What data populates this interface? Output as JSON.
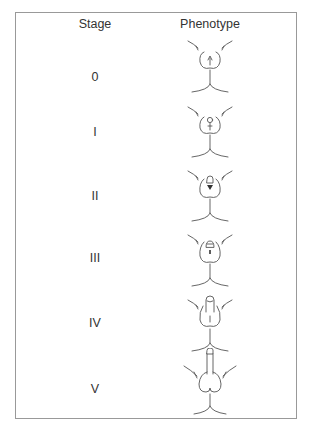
{
  "table": {
    "headers": {
      "stage": "Stage",
      "phenotype": "Phenotype"
    },
    "rows": [
      {
        "stage": "0",
        "phenotype": "stage-0-drawing"
      },
      {
        "stage": "I",
        "phenotype": "stage-I-drawing"
      },
      {
        "stage": "II",
        "phenotype": "stage-II-drawing"
      },
      {
        "stage": "III",
        "phenotype": "stage-III-drawing"
      },
      {
        "stage": "IV",
        "phenotype": "stage-IV-drawing"
      },
      {
        "stage": "V",
        "phenotype": "stage-V-drawing"
      }
    ]
  },
  "colors": {
    "border": "#999999",
    "text": "#333333",
    "line": "#555555"
  }
}
